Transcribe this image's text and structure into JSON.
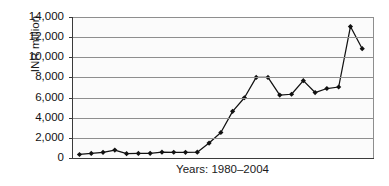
{
  "chart_data": {
    "type": "line",
    "title": "",
    "subtitle": "",
    "xlabel": "Years: 1980–2004",
    "ylabel": "INR million",
    "ylim": [
      0,
      14000
    ],
    "yticks": [
      "0",
      "2,000",
      "4,000",
      "6,000",
      "8,000",
      "10,000",
      "12,000",
      "14,000"
    ],
    "ytick_values": [
      0,
      2000,
      4000,
      6000,
      8000,
      10000,
      12000,
      14000
    ],
    "grid": "horizontal",
    "legend": "none",
    "marker": "diamond",
    "line_color": "#111111",
    "marker_color": "#111111",
    "plot_background": "#fbfbfb",
    "gridline_color": "#8e8e8e",
    "x": [
      1980,
      1981,
      1982,
      1983,
      1984,
      1985,
      1986,
      1987,
      1988,
      1989,
      1990,
      1991,
      1992,
      1993,
      1994,
      1995,
      1996,
      1997,
      1998,
      1999,
      2000,
      2001,
      2002,
      2003,
      2004
    ],
    "xtick_labels": [],
    "series": [
      {
        "name": "INR million",
        "values": [
          350,
          450,
          560,
          790,
          430,
          450,
          460,
          580,
          570,
          560,
          580,
          1480,
          2530,
          4630,
          5980,
          8000,
          8000,
          6250,
          6330,
          7680,
          6500,
          6900,
          7050,
          13050,
          10850
        ]
      }
    ]
  },
  "axis": {
    "y_title": "INR million",
    "x_title": "Years: 1980–2004"
  }
}
